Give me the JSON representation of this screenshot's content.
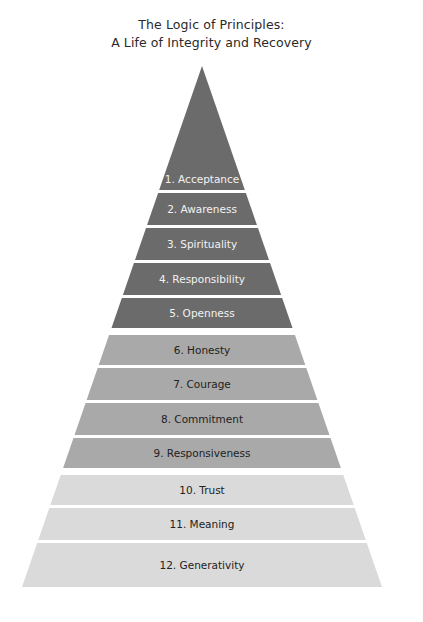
{
  "title": {
    "line1": "The Logic of Principles:",
    "line2": "A Life of Integrity and Recovery"
  },
  "colors": {
    "dark": "#6b6b6b",
    "mid": "#a9a9a9",
    "light": "#dadada",
    "text_on_dark": "#f2f2f2",
    "text_on_light": "#222222",
    "background": "#ffffff"
  },
  "pyramid": {
    "apex": {
      "x": 202,
      "y": 66
    },
    "base_y": 587,
    "base_left_x": 22,
    "base_right_x": 382,
    "bands": [
      {
        "label": "1. Acceptance",
        "group": "dark",
        "top": 66,
        "bottom": 190
      },
      {
        "label": "2. Awareness",
        "group": "dark",
        "top": 193,
        "bottom": 225
      },
      {
        "label": "3. Spirituality",
        "group": "dark",
        "top": 228,
        "bottom": 260
      },
      {
        "label": "4. Responsibility",
        "group": "dark",
        "top": 263,
        "bottom": 295
      },
      {
        "label": "5. Openness",
        "group": "dark",
        "top": 298,
        "bottom": 328
      },
      {
        "label": "6. Honesty",
        "group": "mid",
        "top": 335,
        "bottom": 365
      },
      {
        "label": "7. Courage",
        "group": "mid",
        "top": 368,
        "bottom": 400
      },
      {
        "label": "8. Commitment",
        "group": "mid",
        "top": 403,
        "bottom": 435
      },
      {
        "label": "9. Responsiveness",
        "group": "mid",
        "top": 438,
        "bottom": 468
      },
      {
        "label": "10. Trust",
        "group": "light",
        "top": 475,
        "bottom": 505
      },
      {
        "label": "11. Meaning",
        "group": "light",
        "top": 508,
        "bottom": 540
      },
      {
        "label": "12. Generativity",
        "group": "light",
        "top": 543,
        "bottom": 587
      }
    ]
  }
}
